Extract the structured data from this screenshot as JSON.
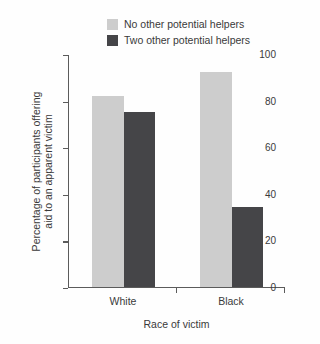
{
  "chart_data": {
    "type": "bar",
    "title": "",
    "subtitle": "",
    "categories": [
      "White",
      "Black"
    ],
    "series": [
      {
        "name": "No other potential helpers",
        "values": [
          82,
          92
        ],
        "color": "#cdcdcd"
      },
      {
        "name": "Two other potential helpers",
        "values": [
          75,
          34
        ],
        "color": "#454548"
      }
    ],
    "xlabel": "Race of victim",
    "ylabel": "Percentage of participants offering aid to an apparent victim",
    "ylabel_line1": "Percentage of participants offering",
    "ylabel_line2": "aid to an apparent victim",
    "ylim": [
      0,
      100
    ],
    "yticks": [
      0,
      20,
      40,
      60,
      80,
      100
    ],
    "ytick_labels": [
      "0",
      "20",
      "40",
      "60",
      "80",
      "100"
    ],
    "grid": false,
    "legend_position": "top-center",
    "axis_color": "#5b5b5b",
    "background_color": "#fefefe",
    "text_color": "#3a3a3a"
  },
  "legend": {
    "items": [
      {
        "label": "No other potential helpers",
        "swatch": "#cdcdcd"
      },
      {
        "label": "Two other potential helpers",
        "swatch": "#454548"
      }
    ]
  },
  "axes": {
    "y": {
      "ticks": [
        {
          "label": "100",
          "value": 100
        },
        {
          "label": "80",
          "value": 80
        },
        {
          "label": "60",
          "value": 60
        },
        {
          "label": "40",
          "value": 40
        },
        {
          "label": "20",
          "value": 20
        },
        {
          "label": "0",
          "value": 0
        }
      ],
      "title_line1": "Percentage of participants offering",
      "title_line2": "aid to an apparent victim"
    },
    "x": {
      "ticks": [
        {
          "label": "White"
        },
        {
          "label": "Black"
        }
      ],
      "title": "Race of victim"
    }
  }
}
